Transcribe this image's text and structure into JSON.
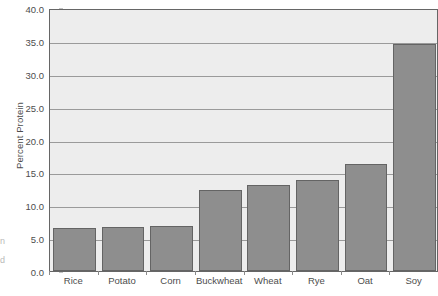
{
  "chart_data": {
    "type": "bar",
    "title": "",
    "xlabel": "",
    "ylabel": "Percent Protein",
    "categories": [
      "Rice",
      "Potato",
      "Corn",
      "Buckwheat",
      "Wheat",
      "Rye",
      "Oat",
      "Soy"
    ],
    "values": [
      6.5,
      6.7,
      6.8,
      12.3,
      13.1,
      13.8,
      16.3,
      34.6
    ],
    "ylim": [
      0.0,
      40.0
    ],
    "y_ticks": [
      0.0,
      5.0,
      10.0,
      15.0,
      20.0,
      25.0,
      30.0,
      35.0,
      40.0
    ],
    "y_tick_labels": [
      "0.0",
      "5.0",
      "10.0",
      "15.0",
      "20.0",
      "25.0",
      "30.0",
      "35.0",
      "40.0"
    ],
    "grid": true,
    "grid_axis": "y",
    "legend": false,
    "legend_position": "none",
    "bar_color": "#8e8e8e",
    "bar_edge_color": "#646464",
    "plot_background": "#ededed",
    "gridline_color": "#9a9a9a",
    "frame_color": "#666666",
    "text_color": "#4d4d4d"
  },
  "axis": {
    "y_title": "Percent Protein"
  },
  "edge_fragments": {
    "line1": "n",
    "line2": "d"
  }
}
